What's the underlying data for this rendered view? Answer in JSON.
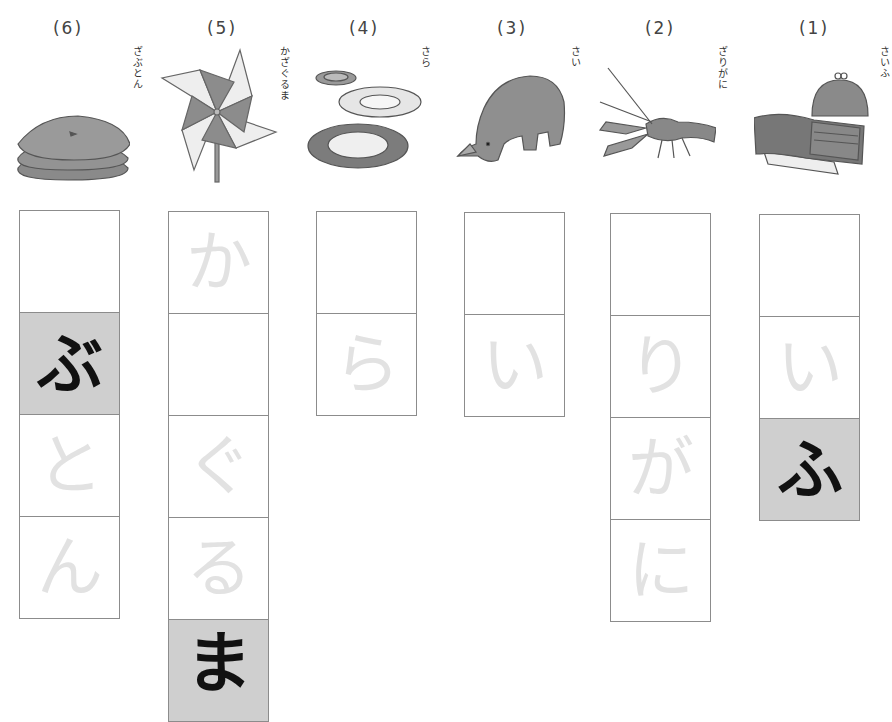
{
  "worksheet": {
    "items": [
      {
        "number": "(6)",
        "word": "ざぶとん",
        "picture": "zabuton-cushions",
        "cells": [
          {
            "char": "ざ",
            "state": "blank"
          },
          {
            "char": "ぶ",
            "state": "model"
          },
          {
            "char": "と",
            "state": "trace"
          },
          {
            "char": "ん",
            "state": "trace"
          }
        ]
      },
      {
        "number": "(5)",
        "word": "かざぐるま",
        "picture": "pinwheel",
        "cells": [
          {
            "char": "か",
            "state": "trace"
          },
          {
            "char": "ざ",
            "state": "blank"
          },
          {
            "char": "ぐ",
            "state": "trace"
          },
          {
            "char": "る",
            "state": "trace"
          },
          {
            "char": "ま",
            "state": "model"
          }
        ]
      },
      {
        "number": "(4)",
        "word": "さら",
        "picture": "plates",
        "cells": [
          {
            "char": "さ",
            "state": "blank"
          },
          {
            "char": "ら",
            "state": "trace"
          }
        ]
      },
      {
        "number": "(3)",
        "word": "さい",
        "picture": "rhinoceros",
        "cells": [
          {
            "char": "さ",
            "state": "blank"
          },
          {
            "char": "い",
            "state": "trace"
          }
        ]
      },
      {
        "number": "(2)",
        "word": "ざりがに",
        "picture": "crayfish",
        "cells": [
          {
            "char": "ざ",
            "state": "blank"
          },
          {
            "char": "り",
            "state": "trace"
          },
          {
            "char": "が",
            "state": "trace"
          },
          {
            "char": "に",
            "state": "trace"
          }
        ]
      },
      {
        "number": "(1)",
        "word": "さいふ",
        "picture": "wallet-and-coin-purse",
        "cells": [
          {
            "char": "さ",
            "state": "blank"
          },
          {
            "char": "い",
            "state": "trace"
          },
          {
            "char": "ふ",
            "state": "model"
          }
        ]
      }
    ]
  },
  "colors": {
    "trace_char": "#e2e2e2",
    "model_bg": "#cfcfcf",
    "model_char": "#111111",
    "grid_line": "#8c8c8c"
  }
}
